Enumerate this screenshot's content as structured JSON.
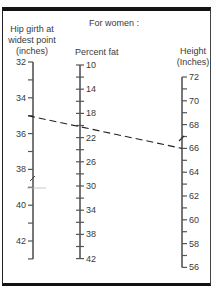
{
  "title": "For women :",
  "scales": {
    "hip": {
      "label_lines": [
        "Hip girth at",
        "widest point",
        "(inches)"
      ],
      "min": 32,
      "max": 43,
      "tick_step": 1,
      "label_step": 2,
      "labels": [
        32,
        34,
        36,
        38,
        40,
        42
      ]
    },
    "fat": {
      "label": "Percent fat",
      "min": 10,
      "max": 42,
      "tick_step": 2,
      "label_step": 4,
      "labels": [
        10,
        14,
        18,
        22,
        26,
        30,
        34,
        38,
        42
      ]
    },
    "height": {
      "label_lines": [
        "Height",
        "(Inches)"
      ],
      "min": 56,
      "max": 72,
      "tick_step": 1,
      "label_step": 2,
      "labels": [
        72,
        70,
        68,
        66,
        64,
        62,
        60,
        58,
        56
      ]
    }
  },
  "reading_line": {
    "style": "dashed",
    "hip_value": 35,
    "fat_value": 21,
    "height_value": 66
  },
  "colors": {
    "ink": "#3a3a3a",
    "axis": "#555555",
    "border": "#111111",
    "line": "#222222"
  }
}
